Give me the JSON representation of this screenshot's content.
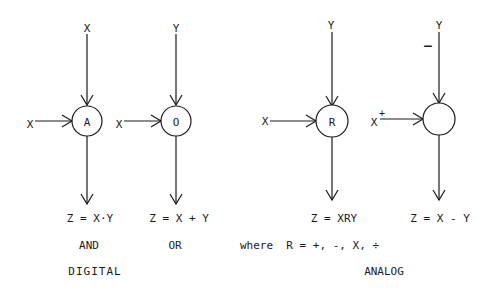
{
  "diagram": {
    "digital": {
      "group_label": "DIGITAL",
      "blocks": [
        {
          "name": "and",
          "circle_label": "A",
          "top_input": "X",
          "left_input": "X",
          "formula": "Z = X·Y",
          "caption": "AND"
        },
        {
          "name": "or",
          "circle_label": "O",
          "top_input": "Y",
          "left_input": "X",
          "formula": "Z = X + Y",
          "caption": "OR"
        }
      ]
    },
    "analog": {
      "group_label": "ANALOG",
      "note": "where  R = +, -, X, ÷",
      "blocks": [
        {
          "name": "general",
          "circle_label": "R",
          "top_input": "Y",
          "left_input": "X",
          "formula": "Z = XRY"
        },
        {
          "name": "subtract",
          "circle_label": "",
          "top_input": "Y",
          "top_sign": "–",
          "left_input": "X",
          "left_sign": "+",
          "formula": "Z = X - Y"
        }
      ]
    }
  }
}
